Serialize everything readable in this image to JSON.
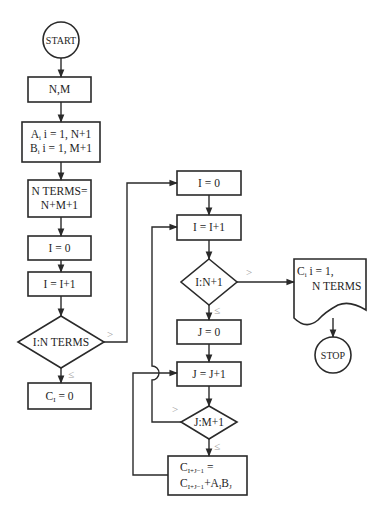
{
  "diagram": {
    "type": "flowchart",
    "nodes": {
      "start": "START",
      "input": "N,M",
      "read_a": "A",
      "read_a_rest": " i = 1, N+1",
      "read_b": "B",
      "read_b_rest": " i = 1, M+1",
      "nterms_1": "N TERMS=",
      "nterms_2": "N+M+1",
      "i_init_left": "I = 0",
      "i_incr_left": "I = I+1",
      "decision_nterms": "I:N TERMS",
      "c_zero": "C",
      "c_zero_rest": " = 0",
      "i_init_right": "I = 0",
      "i_incr_right": "I = I+1",
      "decision_n1": "I:N+1",
      "j_init": "J = 0",
      "j_incr": "J = J+1",
      "decision_m1": "J:M+1",
      "update_line1": "C",
      "update_line1_sub": "I+J−1",
      "update_line1_rest": " =",
      "update_line2": "C",
      "update_line2_sub": "I+J−1",
      "update_line2_rest": "+A",
      "update_line2_b": "B",
      "output_line1": "C",
      "output_line1_rest": " i = 1,",
      "output_line2": "N TERMS",
      "stop": "STOP"
    },
    "subscripts": {
      "i": "i",
      "I": "I",
      "J": "J"
    },
    "conditions": {
      "gt": ">",
      "le": "≤"
    }
  }
}
